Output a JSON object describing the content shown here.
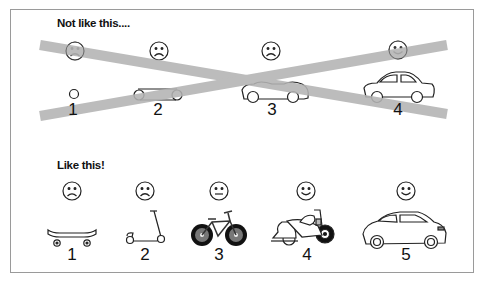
{
  "top_section": {
    "heading": "Not like this....",
    "items": [
      {
        "number": "1",
        "face": "sad",
        "vehicle": "wheel"
      },
      {
        "number": "2",
        "face": "sad",
        "vehicle": "chassis"
      },
      {
        "number": "3",
        "face": "sad",
        "vehicle": "car-body-no-roof"
      },
      {
        "number": "4",
        "face": "happy",
        "vehicle": "car"
      }
    ],
    "crossed_out": true,
    "cross_color": "#b3b3b3"
  },
  "bottom_section": {
    "heading": "Like this!",
    "items": [
      {
        "number": "1",
        "face": "sad",
        "vehicle": "skateboard"
      },
      {
        "number": "2",
        "face": "sad",
        "vehicle": "scooter"
      },
      {
        "number": "3",
        "face": "neutral",
        "vehicle": "bicycle"
      },
      {
        "number": "4",
        "face": "happy",
        "vehicle": "motorcycle"
      },
      {
        "number": "5",
        "face": "happy",
        "vehicle": "car"
      }
    ]
  }
}
